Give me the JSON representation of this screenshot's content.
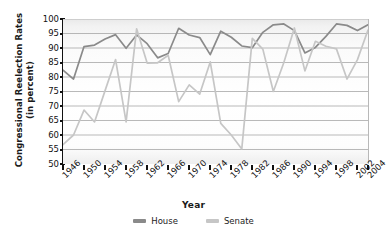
{
  "chart_data": {
    "type": "line",
    "title": "",
    "xlabel": "Year",
    "ylabel": "Congressional Reelection Rates (in percent)",
    "ylabel_line1": "Congressional Reelection Rates",
    "ylabel_line2": "(in percent)",
    "ylim": [
      50,
      100
    ],
    "ytick_values": [
      100,
      95,
      90,
      85,
      80,
      75,
      70,
      65,
      60,
      55,
      50
    ],
    "grid": true,
    "grid_orientation": "horizontal",
    "legend_position": "bottom-center",
    "xlim": [
      1946,
      2004
    ],
    "x": [
      1946,
      1948,
      1950,
      1952,
      1954,
      1956,
      1958,
      1960,
      1962,
      1964,
      1966,
      1968,
      1970,
      1972,
      1974,
      1976,
      1978,
      1980,
      1982,
      1984,
      1986,
      1988,
      1990,
      1992,
      1994,
      1996,
      1998,
      2000,
      2002,
      2004
    ],
    "xtick_labels": [
      "1946",
      "1950",
      "1954",
      "1958",
      "1962",
      "1966",
      "1970",
      "1974",
      "1978",
      "1982",
      "1986",
      "1990",
      "1994",
      "1998",
      "2002",
      "2004"
    ],
    "xtick_values": [
      1946,
      1950,
      1954,
      1958,
      1962,
      1966,
      1970,
      1974,
      1978,
      1982,
      1986,
      1990,
      1994,
      1998,
      2002,
      2004
    ],
    "series": [
      {
        "name": "House",
        "color": "#8a8a8a",
        "values": [
          82.4,
          79.3,
          90.5,
          91.0,
          93.1,
          94.6,
          89.9,
          94.5,
          91.5,
          86.6,
          88.1,
          96.8,
          94.5,
          93.6,
          87.7,
          95.8,
          93.7,
          90.7,
          90.1,
          95.4,
          98.0,
          98.3,
          96.0,
          88.3,
          90.2,
          94.0,
          98.3,
          97.8,
          96.0,
          98.0
        ]
      },
      {
        "name": "Senate",
        "color": "#c6c6c6",
        "values": [
          56.7,
          60.0,
          68.6,
          64.5,
          75.3,
          86.0,
          64.5,
          96.6,
          84.8,
          84.9,
          87.5,
          71.5,
          77.3,
          74.1,
          85.2,
          64.0,
          60.0,
          55.2,
          93.3,
          89.6,
          75.0,
          85.0,
          96.9,
          82.1,
          92.3,
          90.6,
          89.7,
          79.3,
          86.0,
          96.2
        ]
      }
    ]
  },
  "axes": {
    "x_title": "Year",
    "y_title_line1": "Congressional Reelection Rates",
    "y_title_line2": "(in percent)"
  },
  "legend": {
    "items": [
      {
        "label": "House",
        "color": "#8a8a8a"
      },
      {
        "label": "Senate",
        "color": "#c6c6c6"
      }
    ]
  }
}
